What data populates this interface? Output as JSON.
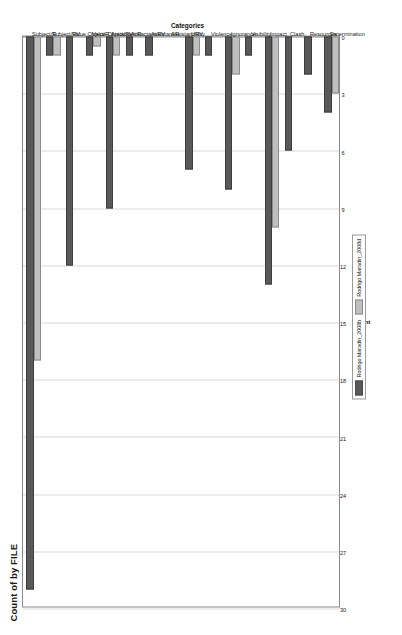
{
  "chart": {
    "title": "Count of by FILE",
    "categories_axis_title": "Categories",
    "value_axis_label": "Count"
  },
  "legend": {
    "items": [
      {
        "label": "Rodrigo Maradin_2008b",
        "color": "#595959"
      },
      {
        "label": "Rodrigo Maradin_2008d",
        "color": "#bfbfbf"
      }
    ]
  },
  "chart_data": {
    "type": "bar",
    "orientation": "horizontal",
    "title": "Count of by FILE",
    "xlabel": "Count",
    "ylabel": "Categories",
    "xlim": [
      0,
      30
    ],
    "xticks": [
      0,
      3,
      6,
      9,
      12,
      15,
      18,
      21,
      24,
      27,
      30
    ],
    "grid": true,
    "legend_position": "bottom",
    "reversed_value_axis": true,
    "categories": [
      "Subject/R",
      "Subject/RV",
      "Value Object/R",
      "Value Object/RV",
      "Antiactant/R",
      "Antiactant/RV",
      "Assistant/R",
      "Assistant/RV",
      "Utility",
      "Violence",
      "Ignorance",
      "Visibility",
      "Impact",
      "Clash",
      "Resources",
      "Determination"
    ],
    "series": [
      {
        "name": "Rodrigo Maradin_2008b",
        "color": "#595959",
        "values": [
          29,
          1,
          12,
          1,
          9,
          1,
          1,
          0,
          7,
          1,
          8,
          1,
          13,
          6,
          2,
          4
        ]
      },
      {
        "name": "Rodrigo Maradin_2008d",
        "color": "#bfbfbf",
        "values": [
          17,
          1,
          0,
          0.5,
          1,
          0,
          0,
          0,
          1,
          0,
          2,
          0,
          10,
          0,
          0,
          3
        ]
      }
    ]
  }
}
